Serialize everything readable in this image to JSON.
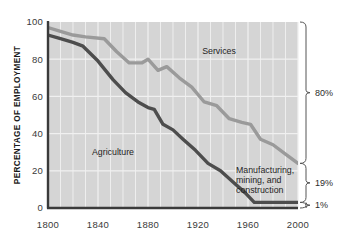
{
  "chart_data": {
    "type": "line",
    "title": "",
    "subtitle": "",
    "xlabel": "",
    "ylabel": "PERCENTAGE OF EMPLOYMENT",
    "xlim": [
      1800,
      2000
    ],
    "ylim": [
      0,
      100
    ],
    "grid": true,
    "grid_x_step": 10,
    "grid_y_step": 20,
    "legend_position": "inline-annotations",
    "xticks": [
      "1800",
      "1840",
      "1880",
      "1920",
      "1960",
      "2000"
    ],
    "xtick_values": [
      1800,
      1840,
      1880,
      1920,
      1960,
      2000
    ],
    "yticks": [
      "0",
      "20",
      "40",
      "60",
      "80",
      "100"
    ],
    "ytick_values": [
      0,
      20,
      40,
      60,
      80,
      100
    ],
    "series": [
      {
        "name": "Services",
        "color": "#9a9a9a",
        "label": "Services",
        "x": [
          1800,
          1810,
          1820,
          1830,
          1845,
          1855,
          1865,
          1875,
          1880,
          1888,
          1895,
          1905,
          1915,
          1925,
          1935,
          1945,
          1955,
          1962,
          1970,
          1980,
          1990,
          2000
        ],
        "values": [
          97,
          95,
          93,
          92,
          91,
          84,
          78,
          78,
          80,
          74,
          76,
          70,
          65,
          57,
          55,
          48,
          46,
          45,
          37,
          34,
          29,
          24
        ]
      },
      {
        "name": "Agriculture",
        "color": "#4d4d4d",
        "label": "Agriculture",
        "x": [
          1800,
          1810,
          1820,
          1828,
          1840,
          1852,
          1862,
          1872,
          1880,
          1885,
          1892,
          1900,
          1908,
          1918,
          1928,
          1938,
          1948,
          1958,
          1965,
          1975,
          1985,
          2000
        ],
        "values": [
          93,
          91,
          89,
          87,
          79,
          69,
          62,
          57,
          54,
          53,
          45,
          42,
          37,
          31,
          24,
          20,
          14,
          8,
          3,
          3,
          3,
          3
        ]
      }
    ],
    "annotations": [
      {
        "name": "services-label",
        "text": "Services",
        "x": 1905,
        "y": 87
      },
      {
        "name": "agriculture-label",
        "text": "Agriculture",
        "x": 1845,
        "y": 33
      },
      {
        "name": "manufacturing-label",
        "lines": [
          "Manufacturing,",
          "mining, and",
          "construction"
        ],
        "x": 1955,
        "y": 20
      }
    ],
    "right_brackets": [
      {
        "name": "services-bracket",
        "label": "80%",
        "from": 24,
        "to": 100
      },
      {
        "name": "manufacturing-bracket",
        "label": "19%",
        "from": 3,
        "to": 24
      },
      {
        "name": "agriculture-bracket",
        "label": "1%",
        "from": 0,
        "to": 3
      }
    ],
    "colors": {
      "plot_background": "#d5d5d5",
      "grid": "#f0f0f0",
      "axis": "#3a3a3a",
      "services": "#9a9a9a",
      "agriculture": "#4d4d4d",
      "page_background": "#ffffff"
    }
  }
}
